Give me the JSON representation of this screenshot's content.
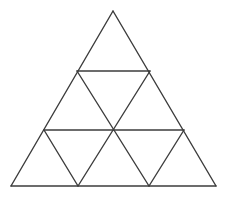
{
  "figure": {
    "name": "subdivided-equilateral-triangle",
    "background_color": "#ffffff",
    "line_color": "#3c3c3c",
    "line_width": 1.4,
    "canvas": {
      "width": 236,
      "height": 202
    },
    "rows": 3,
    "small_triangle_count": 9,
    "upward_triangle_count": 6,
    "downward_triangle_count": 3,
    "vertices": {
      "apex": {
        "id": "apex",
        "x": 113,
        "y": 11
      },
      "row1_left": {
        "id": "row1-left",
        "x": 77,
        "y": 71
      },
      "row1_right": {
        "id": "row1-right",
        "x": 150,
        "y": 71
      },
      "row2_left": {
        "id": "row2-left",
        "x": 44,
        "y": 130
      },
      "row2_center": {
        "id": "row2-center",
        "x": 113,
        "y": 130
      },
      "row2_right": {
        "id": "row2-right",
        "x": 184,
        "y": 130
      },
      "base_left": {
        "id": "base-left",
        "x": 11,
        "y": 186
      },
      "base_mid_left": {
        "id": "base-mid-left",
        "x": 78,
        "y": 186
      },
      "base_mid_right": {
        "id": "base-mid-right",
        "x": 149,
        "y": 186
      },
      "base_right": {
        "id": "base-right",
        "x": 216,
        "y": 186
      }
    },
    "segments": [
      {
        "id": "outer-left-edge",
        "name": "outer-left-edge",
        "x1": 113,
        "y1": 11,
        "x2": 11,
        "y2": 186
      },
      {
        "id": "outer-right-edge",
        "name": "outer-right-edge",
        "x1": 113,
        "y1": 11,
        "x2": 216,
        "y2": 186
      },
      {
        "id": "outer-base-edge",
        "name": "outer-base-edge",
        "x1": 11,
        "y1": 186,
        "x2": 216,
        "y2": 186
      },
      {
        "id": "horizontal-row1",
        "name": "horizontal-divider-upper",
        "x1": 77,
        "y1": 71,
        "x2": 150,
        "y2": 71
      },
      {
        "id": "horizontal-row2",
        "name": "horizontal-divider-lower",
        "x1": 44,
        "y1": 130,
        "x2": 184,
        "y2": 130
      },
      {
        "id": "diag-left-a",
        "name": "diagonal-left-upper",
        "x1": 77,
        "y1": 71,
        "x2": 149,
        "y2": 186
      },
      {
        "id": "diag-left-b",
        "name": "diagonal-left-lower",
        "x1": 44,
        "y1": 130,
        "x2": 78,
        "y2": 186
      },
      {
        "id": "diag-right-a",
        "name": "diagonal-right-upper",
        "x1": 150,
        "y1": 71,
        "x2": 78,
        "y2": 186
      },
      {
        "id": "diag-right-b",
        "name": "diagonal-right-lower",
        "x1": 184,
        "y1": 130,
        "x2": 149,
        "y2": 186
      }
    ]
  }
}
